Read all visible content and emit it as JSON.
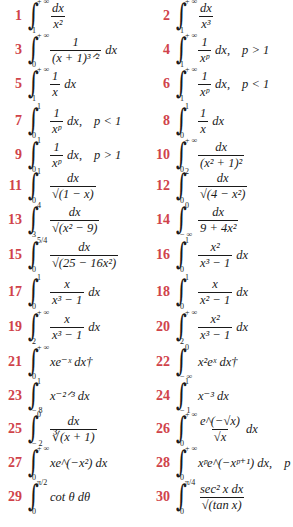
{
  "page": {
    "number_color": "#d0434a",
    "text_color": "#1a1a1a",
    "background": "#ffffff"
  },
  "integrals": [
    {
      "n": "1",
      "upper": "+ ∞",
      "lower": "1",
      "num": "dx",
      "den": "x²",
      "rest": "",
      "cond": ""
    },
    {
      "n": "2",
      "upper": "+ ∞",
      "lower": "1",
      "num": "dx",
      "den": "x³",
      "rest": "",
      "cond": ""
    },
    {
      "n": "3",
      "upper": "+ ∞",
      "lower": "0",
      "num": "1",
      "den": "(x + 1)³ᐟ²",
      "rest": "dx",
      "cond": ""
    },
    {
      "n": "4",
      "upper": "+ ∞",
      "lower": "1",
      "num": "1",
      "den": "xᵖ",
      "rest": "dx,",
      "cond": "p > 1"
    },
    {
      "n": "5",
      "upper": "+ ∞",
      "lower": "1",
      "num": "1",
      "den": "x",
      "rest": "dx",
      "cond": ""
    },
    {
      "n": "6",
      "upper": "+ ∞",
      "lower": "1",
      "num": "1",
      "den": "xᵖ",
      "rest": "dx,",
      "cond": "p < 1"
    },
    {
      "n": "7",
      "upper": "1",
      "lower": "0",
      "num": "1",
      "den": "xᵖ",
      "rest": "dx,",
      "cond": "p < 1"
    },
    {
      "n": "8",
      "upper": "1",
      "lower": "0",
      "num": "1",
      "den": "x",
      "rest": "dx",
      "cond": ""
    },
    {
      "n": "9",
      "upper": "1",
      "lower": "0",
      "num": "1",
      "den": "xᵖ",
      "rest": "dx,",
      "cond": "p > 1"
    },
    {
      "n": "10",
      "upper": "+ ∞",
      "lower": "0",
      "num": "dx",
      "den": "(x² + 1)²",
      "rest": "",
      "cond": ""
    },
    {
      "n": "11",
      "upper": "1",
      "lower": "0",
      "num": "dx",
      "den": "√(1 − x)",
      "rest": "",
      "cond": ""
    },
    {
      "n": "12",
      "upper": "2",
      "lower": "0",
      "num": "dx",
      "den": "√(4 − x²)",
      "rest": "",
      "cond": ""
    },
    {
      "n": "13",
      "upper": "4",
      "lower": "3",
      "num": "dx",
      "den": "√(x² − 9)",
      "rest": "",
      "cond": ""
    },
    {
      "n": "14",
      "upper": "0",
      "lower": "− ∞",
      "num": "dx",
      "den": "9 + 4x²",
      "rest": "",
      "cond": ""
    },
    {
      "n": "15",
      "upper": "5/4",
      "lower": "0",
      "num": "dx",
      "den": "√(25 − 16x²)",
      "rest": "",
      "cond": ""
    },
    {
      "n": "16",
      "upper": "1",
      "lower": "0",
      "num": "x²",
      "den": "x³ − 1",
      "rest": "dx",
      "cond": ""
    },
    {
      "n": "17",
      "upper": "1",
      "lower": "0",
      "num": "x",
      "den": "x³ − 1",
      "rest": "dx",
      "cond": ""
    },
    {
      "n": "18",
      "upper": "1",
      "lower": "0",
      "num": "x",
      "den": "x² − 1",
      "rest": "dx",
      "cond": ""
    },
    {
      "n": "19",
      "upper": "+ ∞",
      "lower": "2",
      "num": "x",
      "den": "x³ − 1",
      "rest": "dx",
      "cond": ""
    },
    {
      "n": "20",
      "upper": "+ ∞",
      "lower": "2",
      "num": "x²",
      "den": "x³ − 1",
      "rest": "dx",
      "cond": ""
    },
    {
      "n": "21",
      "upper": "+ ∞",
      "lower": "0",
      "num": "",
      "den": "",
      "rest": "xe⁻ˣ dx†",
      "cond": ""
    },
    {
      "n": "22",
      "upper": "0",
      "lower": "− ∞",
      "num": "",
      "den": "",
      "rest": "x²eˣ dx†",
      "cond": ""
    },
    {
      "n": "23",
      "upper": "1",
      "lower": "− 8",
      "num": "",
      "den": "",
      "rest": "x⁻²ᐟ³ dx",
      "cond": ""
    },
    {
      "n": "24",
      "upper": "1",
      "lower": "− 1",
      "num": "",
      "den": "",
      "rest": "x⁻³ dx",
      "cond": ""
    },
    {
      "n": "25",
      "upper": "0",
      "lower": "− 2",
      "num": "dx",
      "den": "∛(x + 1)",
      "rest": "",
      "cond": ""
    },
    {
      "n": "26",
      "upper": "+ ∞",
      "lower": "0",
      "num": "e^(−√x)",
      "den": "√x",
      "rest": "dx",
      "cond": ""
    },
    {
      "n": "27",
      "upper": "+ ∞",
      "lower": "0",
      "num": "",
      "den": "",
      "rest": "xe^(−x²) dx",
      "cond": ""
    },
    {
      "n": "28",
      "upper": "+ ∞",
      "lower": "0",
      "num": "",
      "den": "",
      "rest": "xᵖe^(−xᵖ⁺¹) dx,",
      "cond": "p > 0"
    },
    {
      "n": "29",
      "upper": "π/2",
      "lower": "0",
      "num": "",
      "den": "",
      "rest": "cot θ dθ",
      "cond": ""
    },
    {
      "n": "30",
      "upper": "π/4",
      "lower": "0",
      "num": "sec² x dx",
      "den": "√(tan x)",
      "rest": "",
      "cond": ""
    }
  ]
}
